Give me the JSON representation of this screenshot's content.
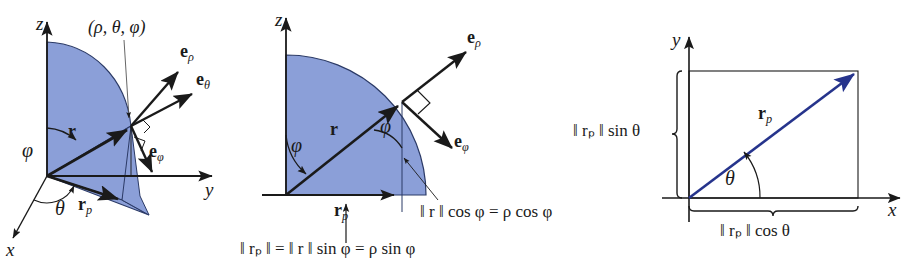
{
  "figure": {
    "colors": {
      "surface_fill": "#8b9fd8",
      "surface_edge": "#2b3a66",
      "ink": "#1a1a1a",
      "blue_vector": "#26348c",
      "background": "#ffffff"
    }
  },
  "panel_left": {
    "name": "spherical-coordinate-octant",
    "axes": {
      "x": "x",
      "y": "y",
      "z": "z"
    },
    "point_label": "(ρ, θ, φ)",
    "vectors": {
      "r": "r",
      "r_p_base": "r",
      "r_p_sub": "p",
      "e_rho_base": "e",
      "e_rho_sub": "ρ",
      "e_theta_base": "e",
      "e_theta_sub": "θ",
      "e_phi_base": "e",
      "e_phi_sub": "φ"
    },
    "angles": {
      "phi": "φ",
      "theta": "θ"
    }
  },
  "panel_mid": {
    "name": "meridian-plane-projection",
    "axes": {
      "z": "z"
    },
    "vectors": {
      "r": "r",
      "r_p_base": "r",
      "r_p_sub": "p",
      "e_rho_base": "e",
      "e_rho_sub": "ρ",
      "e_phi_base": "e",
      "e_phi_sub": "φ"
    },
    "angles": {
      "phi_origin": "φ",
      "phi_point": "φ"
    },
    "formula_vertical": {
      "parts": [
        "‖ ",
        "r",
        " ‖ cos ",
        "φ",
        " = ",
        "ρ",
        " cos ",
        "φ"
      ],
      "plain": "‖ r ‖ cos φ = ρ cos φ"
    },
    "formula_horizontal": {
      "plain": "‖ rₚ ‖ = ‖ r ‖ sin φ = ρ sin φ",
      "lhs_base": "r",
      "lhs_sub": "p",
      "mid_base": "r",
      "sin": "sin",
      "phi": "φ",
      "rho": "ρ"
    }
  },
  "panel_right": {
    "name": "xy-plane-projection",
    "axes": {
      "x": "x",
      "y": "y"
    },
    "vector": {
      "base": "r",
      "sub": "p"
    },
    "angle": "θ",
    "label_vertical": {
      "plain": "‖ rₚ ‖ sin θ",
      "base": "r",
      "sub": "p",
      "trig": "sin",
      "angle": "θ"
    },
    "label_horizontal": {
      "plain": "‖ rₚ ‖ cos θ",
      "base": "r",
      "sub": "p",
      "trig": "cos",
      "angle": "θ"
    }
  }
}
